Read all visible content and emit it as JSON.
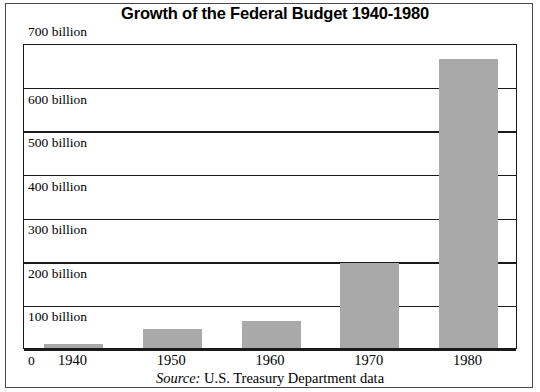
{
  "chart_data": {
    "type": "bar",
    "title": "Growth of the Federal Budget 1940-1980",
    "xlabel": "",
    "ylabel": "",
    "categories": [
      "1940",
      "1950",
      "1960",
      "1970",
      "1980"
    ],
    "values": [
      9,
      43,
      62,
      196,
      664
    ],
    "ylim": [
      0,
      700
    ],
    "ytick_values": [
      0,
      100,
      200,
      300,
      400,
      500,
      600,
      700
    ],
    "ytick_labels": [
      "0",
      "100 billion",
      "200 billion",
      "300 billion",
      "400 billion",
      "500 billion",
      "600 billion",
      "700 billion"
    ],
    "grid": true,
    "legend": false,
    "bar_color": "#a9a9a9",
    "axis_color": "#1a1a1a",
    "frame_color": "#4a4a4a",
    "source_label": "Source:",
    "source_text": " U.S. Treasury Department data"
  }
}
